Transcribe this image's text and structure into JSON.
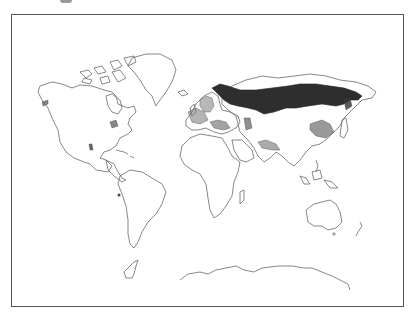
{
  "figure": {
    "type": "distribution-map",
    "projection": "world outline",
    "colors": {
      "background": "#ffffff",
      "coastline": "#6a6a6a",
      "frame": "#555555",
      "range_primary": "#2e2e2e",
      "range_secondary": "#777777"
    },
    "regions": [
      {
        "name": "northern-eurasia-boreal-band",
        "style": "solid-dark"
      },
      {
        "name": "scandinavia-patch",
        "style": "hatched"
      },
      {
        "name": "central-europe-alps-patch",
        "style": "hatched"
      },
      {
        "name": "caucasus-patch",
        "style": "hatched"
      },
      {
        "name": "central-asia-patch",
        "style": "hatched"
      },
      {
        "name": "himalaya-patch",
        "style": "hatched"
      },
      {
        "name": "east-asia-japan-patch",
        "style": "hatched"
      },
      {
        "name": "north-america-great-lakes-marks",
        "style": "marks"
      },
      {
        "name": "rocky-mountains-mark",
        "style": "marks"
      }
    ]
  }
}
